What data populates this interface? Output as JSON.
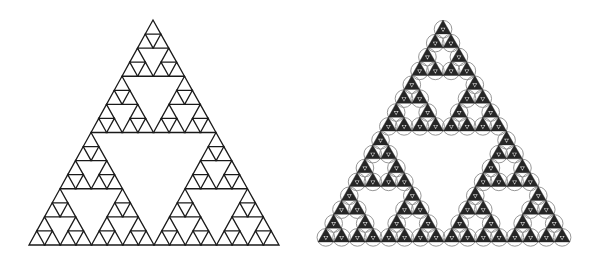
{
  "figure": {
    "width": 596,
    "height": 264,
    "background": "#ffffff",
    "panels": [
      {
        "id": "left",
        "label": "Sierpinski triangle outline",
        "style": "outline",
        "depth": 4,
        "apex": [
          153,
          20
        ],
        "base_left": [
          29,
          245
        ],
        "base_right": [
          279,
          245
        ],
        "stroke": "#1a1a1a",
        "stroke_width": 1.3
      },
      {
        "id": "right",
        "label": "Sierpinski triangle with filled cells and circles",
        "style": "filled-circles",
        "depth": 4,
        "apex": [
          443,
          20
        ],
        "base_left": [
          318,
          242
        ],
        "base_right": [
          570,
          242
        ],
        "fill": "#262626",
        "circle_stroke": "#8a8a8a",
        "circle_width": 0.9,
        "inner_fill": "#cfcfcf"
      }
    ]
  }
}
